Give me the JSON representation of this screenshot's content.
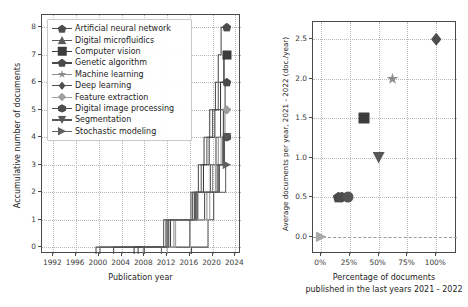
{
  "chart_data": [
    {
      "id": "left",
      "type": "line",
      "title": "",
      "xlabel": "Publication year",
      "ylabel": "Accumulative number of documents",
      "xlim": [
        1990,
        2025
      ],
      "ylim": [
        -0.25,
        8.45
      ],
      "xticks": [
        1992,
        1996,
        2000,
        2004,
        2008,
        2012,
        2016,
        2020,
        2024
      ],
      "yticks": [
        0,
        1,
        2,
        3,
        4,
        5,
        6,
        7,
        8
      ],
      "grid": true,
      "legend_position": "upper left",
      "step_style": "post",
      "series": [
        {
          "name": "Artificial neural network",
          "marker": "pentagon",
          "color": "#4d4d4d",
          "end_value": 8,
          "x": [
            1999.5,
            2012.0,
            2016.5,
            2017.5,
            2018.5,
            2019.5,
            2020.5,
            2021.0,
            2021.5,
            2022.5
          ],
          "y": [
            0,
            1,
            2,
            3,
            4,
            5,
            6,
            7,
            8,
            8
          ]
        },
        {
          "name": "Digital microfluidics",
          "marker": "triangle-up",
          "color": "#5a5a5a",
          "end_value": 7,
          "x": [
            2000.2,
            2012.3,
            2017.0,
            2018.0,
            2019.0,
            2020.0,
            2021.0,
            2022.0,
            2022.5
          ],
          "y": [
            0,
            1,
            2,
            3,
            4,
            5,
            6,
            7,
            7
          ]
        },
        {
          "name": "Computer vision",
          "marker": "square",
          "color": "#3c3c3c",
          "end_value": 7,
          "x": [
            2006.2,
            2012.6,
            2017.4,
            2018.4,
            2019.4,
            2020.4,
            2021.4,
            2022.0,
            2022.5
          ],
          "y": [
            0,
            1,
            2,
            3,
            4,
            5,
            6,
            7,
            7
          ]
        },
        {
          "name": "Genetic algorithm",
          "marker": "pentagon",
          "color": "#4a4a4a",
          "end_value": 6,
          "x": [
            2006.9,
            2016.0,
            2018.6,
            2019.6,
            2020.6,
            2021.4,
            2022.2,
            2022.5
          ],
          "y": [
            0,
            1,
            2,
            3,
            4,
            5,
            6,
            6
          ]
        },
        {
          "name": "Machine learning",
          "marker": "star",
          "color": "#8d8d8d",
          "end_value": 5,
          "x": [
            2007.8,
            2013.2,
            2019.0,
            2020.0,
            2021.0,
            2022.0,
            2022.5
          ],
          "y": [
            0,
            1,
            2,
            3,
            4,
            5,
            5
          ]
        },
        {
          "name": "Deep learning",
          "marker": "thin-diamond",
          "color": "#4d4d4d",
          "end_value": 5,
          "x": [
            2016.3,
            2019.2,
            2020.2,
            2021.2,
            2021.9,
            2022.5
          ],
          "y": [
            0,
            1,
            2,
            3,
            5,
            5
          ]
        },
        {
          "name": "Feature extraction",
          "marker": "diamond",
          "color": "#9e9e9e",
          "end_value": 5,
          "x": [
            2012.0,
            2013.5,
            2019.5,
            2020.5,
            2021.5,
            2022.2,
            2022.5
          ],
          "y": [
            0,
            1,
            2,
            3,
            4,
            5,
            5
          ]
        },
        {
          "name": "Digital image processing",
          "marker": "hexagon",
          "color": "#4d4d4d",
          "end_value": 4,
          "x": [
            2002.6,
            2011.8,
            2016.8,
            2020.8,
            2021.8,
            2022.5
          ],
          "y": [
            0,
            1,
            2,
            3,
            4,
            4
          ]
        },
        {
          "name": "Segmentation",
          "marker": "triangle-down",
          "color": "#575757",
          "end_value": 4,
          "x": [
            2008.0,
            2011.4,
            2016.2,
            2021.0,
            2022.1,
            2022.5
          ],
          "y": [
            0,
            1,
            2,
            3,
            4,
            4
          ]
        },
        {
          "name": "Stochastic modeling",
          "marker": "triangle-right",
          "color": "#606060",
          "end_value": 3,
          "x": [
            2011.0,
            2012.2,
            2017.2,
            2022.3,
            2022.5
          ],
          "y": [
            0,
            1,
            2,
            3,
            3
          ]
        }
      ]
    },
    {
      "id": "right",
      "type": "scatter",
      "title": "",
      "xlabel": "Percentage of documents\npublished in the last years 2021 - 2022",
      "xlabel_line1": "Percentage of documents",
      "xlabel_line2": "published in the last years 2021 - 2022",
      "ylabel": "Average documents per year, 2021 - 2022 (doc./year)",
      "xlim": [
        -7,
        118
      ],
      "ylim": [
        -0.22,
        2.72
      ],
      "xticks": [
        0,
        25,
        50,
        75,
        100
      ],
      "xticklabels": [
        "0%",
        "25%",
        "50%",
        "75%",
        "100%"
      ],
      "yticks": [
        0.0,
        0.5,
        1.0,
        1.5,
        2.0,
        2.5
      ],
      "yticklabels": [
        "0.0",
        "0.5",
        "1.0",
        "1.5",
        "2.0",
        "2.5"
      ],
      "grid": true,
      "zero_line": true,
      "points": [
        {
          "name": "Artificial neural network",
          "x": 100,
          "y": 2.5,
          "marker": "thin-diamond",
          "color": "#4d4d4d",
          "size": 13
        },
        {
          "name": "Digital microfluidics",
          "x": 62,
          "y": 2.0,
          "marker": "star",
          "color": "#8d8d8d",
          "size": 12
        },
        {
          "name": "Computer vision",
          "x": 37,
          "y": 1.5,
          "marker": "square",
          "color": "#3c3c3c",
          "size": 11
        },
        {
          "name": "Genetic algorithm",
          "x": 50,
          "y": 1.0,
          "marker": "triangle-down",
          "color": "#575757",
          "size": 12
        },
        {
          "name": "Machine learning",
          "x": 15,
          "y": 0.5,
          "marker": "pentagon",
          "color": "#4a4a4a",
          "size": 11
        },
        {
          "name": "Deep learning",
          "x": 18,
          "y": 0.5,
          "marker": "hexagon",
          "color": "#4d4d4d",
          "size": 11
        },
        {
          "name": "Feature extraction",
          "x": 23,
          "y": 0.5,
          "marker": "circle",
          "color": "#555555",
          "size": 11
        },
        {
          "name": "Stochastic modeling",
          "x": 0,
          "y": 0.0,
          "marker": "triangle-right",
          "color": "#a8a8a8",
          "size": 11
        }
      ]
    }
  ],
  "left_panel": {
    "legend_title": "",
    "legend_items": [
      "Artificial neural network",
      "Digital microfluidics",
      "Computer vision",
      "Genetic algorithm",
      "Machine learning",
      "Deep learning",
      "Feature extraction",
      "Digital image processing",
      "Segmentation",
      "Stochastic modeling"
    ],
    "xlabel": "Publication year",
    "ylabel": "Accumulative number of documents",
    "xticklabels": [
      "1992",
      "1996",
      "2000",
      "2004",
      "2008",
      "2012",
      "2016",
      "2020",
      "2024"
    ],
    "yticklabels": [
      "0",
      "1",
      "2",
      "3",
      "4",
      "5",
      "6",
      "7",
      "8"
    ]
  },
  "right_panel": {
    "xlabel_line1": "Percentage of documents",
    "xlabel_line2": "published in the last years 2021 - 2022",
    "ylabel": "Average documents per year, 2021 - 2022 (doc./year)",
    "xticklabels": [
      "0%",
      "25%",
      "50%",
      "75%",
      "100%"
    ],
    "yticklabels": [
      "0.0",
      "0.5",
      "1.0",
      "1.5",
      "2.0",
      "2.5"
    ]
  },
  "colors": {
    "axis": "#4a4a4a",
    "grid": "#b9b9b9",
    "text": "#1d1d1d",
    "background": "#ffffff"
  }
}
